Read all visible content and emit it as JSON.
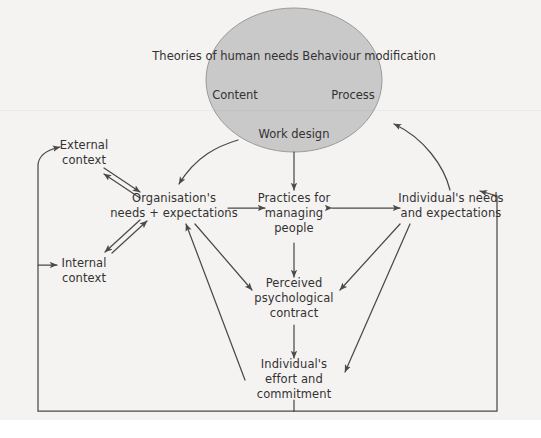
{
  "diagram": {
    "title_present": false,
    "background_color": "#f4f3f1",
    "stroke_color": "#4a4a4a",
    "text_color": "#333132",
    "ellipse": {
      "fill_color": "#c9c9c9",
      "stroke_color": "#8a8a8a",
      "cx": 294,
      "cy": 80,
      "rx": 88,
      "ry": 72,
      "lines": [
        "Theories of",
        "human needs",
        "Behaviour modification"
      ],
      "side_labels": [
        {
          "name": "content",
          "text": "Content",
          "x": 235,
          "y": 95
        },
        {
          "name": "process",
          "text": "Process",
          "x": 353,
          "y": 95
        }
      ],
      "work_design": {
        "lines": [
          "Work",
          "design"
        ],
        "x": 294,
        "y": 134
      }
    },
    "nodes": [
      {
        "id": "external-context",
        "lines": [
          "External",
          "context"
        ],
        "x": 84,
        "y": 153
      },
      {
        "id": "internal-context",
        "lines": [
          "Internal",
          "context"
        ],
        "x": 84,
        "y": 271
      },
      {
        "id": "organisations-needs",
        "lines": [
          "Organisation's",
          "needs + expectations"
        ],
        "x": 174,
        "y": 206
      },
      {
        "id": "practices-for-managing-people",
        "lines": [
          "Practices for",
          "managing",
          "people"
        ],
        "x": 294,
        "y": 213
      },
      {
        "id": "individuals-needs",
        "lines": [
          "Individual's needs",
          "and expectations"
        ],
        "x": 451,
        "y": 206
      },
      {
        "id": "perceived-psychological-contract",
        "lines": [
          "Perceived",
          "psychological",
          "contract"
        ],
        "x": 294,
        "y": 298
      },
      {
        "id": "individuals-effort",
        "lines": [
          "Individual's",
          "effort and",
          "commitment"
        ],
        "x": 294,
        "y": 379
      }
    ],
    "connectors": [
      {
        "id": "ellipse-to-organisation",
        "type": "curved-arrow",
        "from": "ellipse",
        "to": "organisations-needs"
      },
      {
        "id": "ellipse-to-practices",
        "type": "straight-arrow",
        "from": "ellipse",
        "to": "practices-for-managing-people"
      },
      {
        "id": "individuals-needs-to-ellipse",
        "type": "curved-arrow",
        "from": "individuals-needs",
        "to": "ellipse"
      },
      {
        "id": "external-context-organisation-pair",
        "type": "bidirectional-pair",
        "from": "external-context",
        "to": "organisations-needs"
      },
      {
        "id": "internal-context-organisation-pair",
        "type": "bidirectional-pair",
        "from": "internal-context",
        "to": "organisations-needs"
      },
      {
        "id": "organisation-to-practices",
        "type": "straight-arrow",
        "from": "organisations-needs",
        "to": "practices-for-managing-people"
      },
      {
        "id": "practices-individuals-double",
        "type": "double-headed-arrow",
        "from": "practices-for-managing-people",
        "to": "individuals-needs"
      },
      {
        "id": "practices-to-contract",
        "type": "straight-arrow",
        "from": "practices-for-managing-people",
        "to": "perceived-psychological-contract"
      },
      {
        "id": "organisation-to-contract",
        "type": "straight-arrow",
        "from": "organisations-needs",
        "to": "perceived-psychological-contract"
      },
      {
        "id": "individuals-needs-to-contract",
        "type": "straight-arrow",
        "from": "individuals-needs",
        "to": "perceived-psychological-contract"
      },
      {
        "id": "contract-to-effort",
        "type": "straight-arrow",
        "from": "perceived-psychological-contract",
        "to": "individuals-effort"
      },
      {
        "id": "effort-to-organisation",
        "type": "straight-arrow",
        "from": "individuals-effort",
        "to": "organisations-needs"
      },
      {
        "id": "effort-to-individuals-needs",
        "type": "straight-arrow",
        "from": "individuals-effort",
        "to": "individuals-needs"
      },
      {
        "id": "feedback-loop-left",
        "type": "polyline-arrow",
        "from": "individuals-effort",
        "to": "external-context"
      },
      {
        "id": "feedback-loop-internal",
        "type": "branch-arrow",
        "from": "feedback-loop-left",
        "to": "internal-context"
      },
      {
        "id": "feedback-loop-right",
        "type": "polyline-arrow",
        "from": "individuals-effort",
        "to": "individuals-needs"
      }
    ]
  }
}
